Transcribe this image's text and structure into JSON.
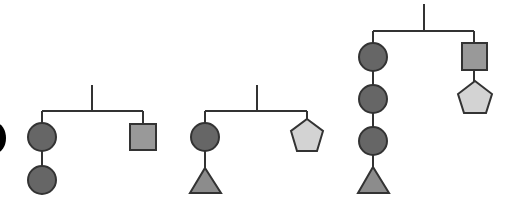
{
  "diagram": {
    "type": "hanging-mobiles",
    "count": 3,
    "colors": {
      "line": "#333333",
      "circle": "#666666",
      "square": "#999999",
      "triangle": "#8c8c8c",
      "pentagon": "#d3d3d3",
      "edge_blob": "#000000"
    },
    "mobiles": [
      {
        "name": "mobile-1",
        "left_arm": [
          "circle",
          "circle"
        ],
        "right_arm": [
          "square"
        ]
      },
      {
        "name": "mobile-2",
        "left_arm": [
          "circle",
          "triangle"
        ],
        "right_arm": [
          "pentagon"
        ]
      },
      {
        "name": "mobile-3",
        "left_arm": [
          "circle",
          "circle",
          "circle",
          "triangle"
        ],
        "right_arm": [
          "square",
          "pentagon"
        ]
      }
    ]
  }
}
